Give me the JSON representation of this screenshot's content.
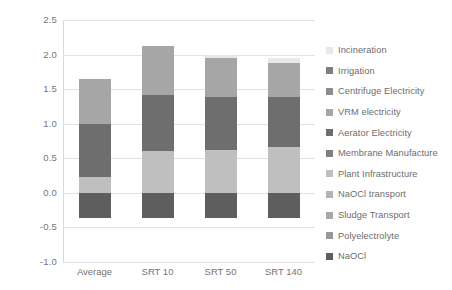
{
  "chart_data": {
    "type": "bar",
    "title": "",
    "subtitle": "",
    "stacked": true,
    "xlabel": "",
    "ylabel": "CC [kg CO2 eq/m3]",
    "ylabel_display": "CC [kg CO₂ eq/m³]",
    "ylim": [
      -1.0,
      2.5
    ],
    "ytick_values": [
      -1.0,
      -0.5,
      0.0,
      0.5,
      1.0,
      1.5,
      2.0,
      2.5
    ],
    "ytick_labels": [
      "-1.0",
      "-0.5",
      "0.0",
      "0.5",
      "1.0",
      "1.5",
      "2.0",
      "2.5"
    ],
    "grid": true,
    "grid_axis": "y",
    "legend_position": "right",
    "categories": [
      "Average",
      "SRT 10",
      "SRT 50",
      "SRT 140"
    ],
    "series": [
      {
        "name": "Incineration",
        "color": "#e8e8e8",
        "values": [
          0.0,
          0.0,
          0.05,
          0.07
        ]
      },
      {
        "name": "Irrigation",
        "color": "#7f7f7f",
        "values": [
          0.0,
          0.0,
          0.0,
          0.0
        ]
      },
      {
        "name": "Centrifuge Electricity",
        "color": "#8c8c8c",
        "values": [
          0.0,
          0.0,
          0.0,
          0.0
        ]
      },
      {
        "name": "VRM electricity",
        "color": "#a6a6a6",
        "values": [
          0.65,
          0.7,
          0.57,
          0.5
        ]
      },
      {
        "name": "Aerator Electricity",
        "color": "#6e6e6e",
        "values": [
          0.77,
          0.81,
          0.76,
          0.72
        ]
      },
      {
        "name": "Membrane Manufacture",
        "color": "#808080",
        "values": [
          0.0,
          0.0,
          0.0,
          0.0
        ]
      },
      {
        "name": "Plant Infrastructure",
        "color": "#bfbfbf",
        "values": [
          0.23,
          0.61,
          0.62,
          0.66
        ]
      },
      {
        "name": "NaOCl transport",
        "color": "#b3b3b3",
        "values": [
          0.0,
          0.0,
          0.0,
          0.0
        ]
      },
      {
        "name": "Sludge Transport",
        "color": "#a8a8a8",
        "values": [
          0.0,
          0.0,
          0.0,
          0.0
        ]
      },
      {
        "name": "Polyelectrolyte",
        "color": "#999999",
        "values": [
          0.0,
          0.0,
          0.0,
          0.0
        ]
      },
      {
        "name": "NaOCl",
        "color": "#5e5e5e",
        "values": [
          -0.37,
          -0.37,
          -0.37,
          -0.37
        ]
      }
    ],
    "stack_order_bottom_to_top": [
      "NaOCl",
      "Plant Infrastructure",
      "Aerator Electricity",
      "VRM electricity",
      "Incineration"
    ],
    "bar_totals_positive": [
      1.65,
      2.12,
      1.95,
      1.88
    ],
    "bar_totals_negative": [
      -0.37,
      -0.37,
      -0.37,
      -0.37
    ],
    "bar_segment_boundaries": {
      "Average": [
        -0.37,
        0.0,
        0.23,
        1.0,
        1.65,
        1.65
      ],
      "SRT 10": [
        -0.37,
        0.0,
        0.61,
        1.42,
        2.12,
        2.12
      ],
      "SRT 50": [
        -0.37,
        0.0,
        0.62,
        1.38,
        1.95,
        2.0
      ],
      "SRT 140": [
        -0.37,
        0.0,
        0.66,
        1.38,
        1.88,
        1.95
      ]
    }
  },
  "legend": {
    "items": [
      {
        "label": "Incineration",
        "color": "#e8e8e8"
      },
      {
        "label": "Irrigation",
        "color": "#7f7f7f"
      },
      {
        "label": "Centrifuge Electricity",
        "color": "#8c8c8c"
      },
      {
        "label": "VRM electricity",
        "color": "#a6a6a6"
      },
      {
        "label": "Aerator Electricity",
        "color": "#6e6e6e"
      },
      {
        "label": "Membrane Manufacture",
        "color": "#808080"
      },
      {
        "label": "Plant Infrastructure",
        "color": "#bfbfbf"
      },
      {
        "label": "NaOCl transport",
        "color": "#b3b3b3"
      },
      {
        "label": "Sludge Transport",
        "color": "#a8a8a8"
      },
      {
        "label": "Polyelectrolyte",
        "color": "#999999"
      },
      {
        "label": "NaOCl",
        "color": "#5e5e5e"
      }
    ]
  },
  "axis": {
    "y_title": "CC [kg CO₂ eq/m³]"
  },
  "colors": {
    "gridline": "#e2e2e2",
    "tick_text": "#757575",
    "legend_text": "#6d6d6d",
    "background": "#ffffff"
  }
}
